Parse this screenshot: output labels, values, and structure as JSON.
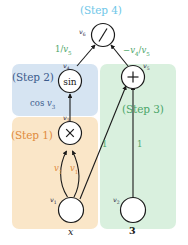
{
  "diagram": {
    "title_region": "(Step 4)",
    "regions": [
      {
        "id": "step1",
        "label": "(Step 1)",
        "fill": "#fae6c8",
        "text_color": "#e08a3c"
      },
      {
        "id": "step2",
        "label": "(Step 2)",
        "fill": "#d6e4f2",
        "text_color": "#3b5b8c"
      },
      {
        "id": "step3",
        "label": "(Step 3)",
        "fill": "#d9f0de",
        "text_color": "#4aa568"
      },
      {
        "id": "step4",
        "label": "(Step 4)",
        "fill": "#ffffff",
        "text_color": "#6ec6e8"
      }
    ],
    "nodes": [
      {
        "id": "n_div",
        "op": "/",
        "var": "v",
        "sub": "6"
      },
      {
        "id": "n_sin",
        "op": "sin",
        "var": "v",
        "sub": "4"
      },
      {
        "id": "n_add",
        "op": "+",
        "var": "v",
        "sub": "5"
      },
      {
        "id": "n_mul",
        "op": "×",
        "var": "v",
        "sub": "3"
      },
      {
        "id": "n_x",
        "op": "",
        "var": "v",
        "sub": "1",
        "leaf": "x",
        "leaf_italic": true
      },
      {
        "id": "n_3",
        "op": "",
        "var": "v",
        "sub": "2",
        "leaf": "3",
        "leaf_italic": false
      }
    ],
    "edge_labels": [
      {
        "id": "e_div_left",
        "text": "1/v5",
        "display": "1/<span class=\"it\">v</span><sub>5</sub>",
        "color": "#4aa568"
      },
      {
        "id": "e_div_right",
        "text": "-v4/v5",
        "display": "−<span class=\"it\">v</span><sub>4</sub>/<span class=\"it\">v</span><sub>5</sub>",
        "color": "#4aa568"
      },
      {
        "id": "e_sin",
        "text": "cos v3",
        "display": "cos <span class=\"it\">v</span><sub>3</sub>",
        "color": "#3b5b8c"
      },
      {
        "id": "e_mul_left",
        "text": "v1",
        "display": "<span class=\"it\">v</span><sub>1</sub>",
        "color": "#e08a3c"
      },
      {
        "id": "e_mul_right",
        "text": "v1",
        "display": "<span class=\"it\">v</span><sub>1</sub>",
        "color": "#e08a3c"
      },
      {
        "id": "e_add_left",
        "text": "1",
        "display": "1",
        "color": "#4aa568"
      },
      {
        "id": "e_add_right",
        "text": "1",
        "display": "1",
        "color": "#4aa568"
      }
    ],
    "node_var_labels": [
      {
        "id": "lbl_v6",
        "display": "<span>v</span><sub>6</sub>"
      },
      {
        "id": "lbl_v4",
        "display": "<span>v</span><sub>4</sub>"
      },
      {
        "id": "lbl_v5",
        "display": "<span>v</span><sub>5</sub>"
      },
      {
        "id": "lbl_v3",
        "display": "<span>v</span><sub>3</sub>"
      },
      {
        "id": "lbl_v1",
        "display": "<span>v</span><sub>1</sub>"
      },
      {
        "id": "lbl_v2",
        "display": "<span>v</span><sub>2</sub>"
      }
    ],
    "leaf_names": [
      {
        "id": "leaf_x",
        "text": "x"
      },
      {
        "id": "leaf_3",
        "text": "3"
      }
    ]
  }
}
